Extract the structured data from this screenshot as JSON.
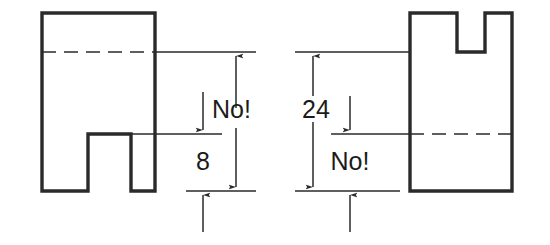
{
  "figure": {
    "background_color": "#ffffff",
    "ink_color": "#2a2a2a",
    "text_color": "#1b1b1b",
    "width": 550,
    "height": 245
  },
  "views": [
    {
      "id": "left-view",
      "name": "left-part-view",
      "description": "Rectangular block with a rectangular notch cut out of the bottom edge",
      "outline_points": "42,13 155,13 155,191 131,191 131,134 88,134 88,191 42,191",
      "hidden_line": {
        "name": "left-hidden-line",
        "x1": 42,
        "y1": 52,
        "x2": 155,
        "y2": 52
      }
    },
    {
      "id": "right-view",
      "name": "right-part-view",
      "description": "Rectangular block with a rectangular notch cut out of the top edge",
      "outline_points": "410,13 457,13 457,52 485,52 485,13 512,13 512,191 410,191",
      "hidden_line": {
        "name": "right-hidden-line",
        "x1": 410,
        "y1": 134,
        "x2": 512,
        "y2": 134
      }
    }
  ],
  "dimensions": [
    {
      "id": "left-outer",
      "name": "left-outer-dimension",
      "label": "No!",
      "label_x": 212,
      "label_y": 111,
      "arrow_x": 236,
      "top_y": 52,
      "bottom_y": 191,
      "extension_top": {
        "x1": 155,
        "y1": 52,
        "x2": 256,
        "y2": 52
      },
      "extension_bottom": {
        "x1": 186,
        "y1": 191,
        "x2": 256,
        "y2": 191
      },
      "arrow_direction": "both-outward"
    },
    {
      "id": "left-inner",
      "name": "left-inner-dimension",
      "label": "8",
      "label_x": 203,
      "label_y": 163,
      "arrow_x": 203,
      "top_y": 134,
      "bottom_y": 191,
      "extension_top": {
        "x1": 131,
        "y1": 134,
        "x2": 222,
        "y2": 134
      },
      "extension_bottom": {
        "x1": 186,
        "y1": 191,
        "x2": 256,
        "y2": 191
      },
      "arrow_direction": "both-inward"
    },
    {
      "id": "right-outer",
      "name": "right-outer-dimension",
      "label": "24",
      "label_x": 316,
      "label_y": 111,
      "arrow_x": 313,
      "top_y": 52,
      "bottom_y": 191,
      "extension_top": {
        "x1": 295,
        "y1": 52,
        "x2": 410,
        "y2": 52
      },
      "extension_bottom": {
        "x1": 295,
        "y1": 191,
        "x2": 400,
        "y2": 191
      },
      "arrow_direction": "both-inward"
    },
    {
      "id": "right-inner",
      "name": "right-inner-dimension",
      "label": "No!",
      "label_x": 350,
      "label_y": 163,
      "arrow_x": 350,
      "top_y": 134,
      "bottom_y": 191,
      "extension_top": {
        "x1": 331,
        "y1": 134,
        "x2": 410,
        "y2": 134
      },
      "extension_bottom": {
        "x1": 295,
        "y1": 191,
        "x2": 400,
        "y2": 191
      },
      "arrow_direction": "top-inward-bottom-outward"
    }
  ],
  "style": {
    "outline_width": 3.4,
    "thin_line_width": 1.5,
    "dash_pattern": "14 8",
    "label_font_size": 25
  }
}
